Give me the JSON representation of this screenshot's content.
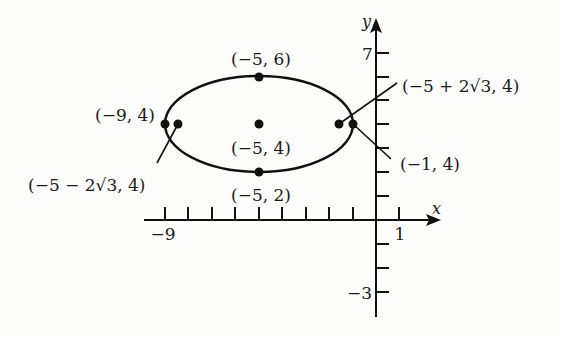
{
  "diagram": {
    "type": "ellipse-graph",
    "axes": {
      "x_label": "x",
      "y_label": "y",
      "x_ticks": [
        -9,
        -8,
        -7,
        -6,
        -5,
        -4,
        -3,
        -2,
        -1,
        1
      ],
      "y_ticks": [
        7,
        6,
        5,
        4,
        3,
        2,
        1,
        -1,
        -2,
        -3
      ],
      "x_tick_labels": {
        "left": "−9",
        "right": "1"
      },
      "y_tick_labels": {
        "top": "7",
        "bottom": "−3"
      }
    },
    "ellipse": {
      "center": [
        -5,
        4
      ],
      "semi_major": 4,
      "semi_minor": 2
    },
    "points": {
      "top_vertex": {
        "coords": [
          -5,
          6
        ],
        "label": "(−5, 6)"
      },
      "bottom_vertex": {
        "coords": [
          -5,
          2
        ],
        "label": "(−5, 2)"
      },
      "center": {
        "coords": [
          -5,
          4
        ],
        "label": "(−5, 4)"
      },
      "left_vertex": {
        "coords": [
          -9,
          4
        ],
        "label": "(−9, 4)"
      },
      "right_vertex": {
        "coords": [
          -1,
          4
        ],
        "label": "(−1, 4)"
      },
      "left_focus": {
        "coords": [
          "-5-2√3",
          4
        ],
        "label": "(−5 − 2√3, 4)"
      },
      "right_focus": {
        "coords": [
          "-5+2√3",
          4
        ],
        "label": "(−5 + 2√3, 4)"
      }
    }
  }
}
